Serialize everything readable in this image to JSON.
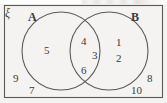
{
  "diagram": {
    "type": "venn-2-set",
    "universe_symbol": "ξ",
    "sets": [
      {
        "key": "A",
        "label": "A"
      },
      {
        "key": "B",
        "label": "B"
      }
    ],
    "regions": {
      "a_only": {
        "name": "A only",
        "elements": [
          "5"
        ]
      },
      "intersection": {
        "name": "A and B",
        "elements": [
          "4",
          "3",
          "6"
        ]
      },
      "b_only": {
        "name": "B only",
        "elements": [
          "1",
          "2"
        ]
      },
      "outside": {
        "name": "Outside A and B",
        "elements": [
          "9",
          "7",
          "8",
          "10"
        ]
      }
    },
    "elements": {
      "a_only_5": "5",
      "inter_4": "4",
      "inter_3": "3",
      "inter_6": "6",
      "b_only_1": "1",
      "b_only_2": "2",
      "out_9": "9",
      "out_7": "7",
      "out_8": "8",
      "out_10": "10"
    },
    "colors": {
      "stroke": "#5a5a5a",
      "text": "#3a3a3a",
      "background": "#f4f3f1"
    }
  }
}
